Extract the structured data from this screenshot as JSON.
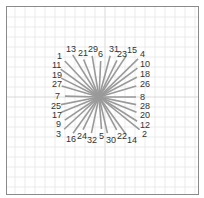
{
  "diagram": {
    "type": "radial-spoke-test-pattern",
    "center": [
      99,
      97
    ],
    "spoke_color": "#9a9a9a",
    "grid_color": "#e6e6e6",
    "grid_major_color": "#cfcfcf",
    "frame_color": "#8a8a8a",
    "labels": [
      {
        "text": "1",
        "x": 57,
        "y": 59
      },
      {
        "text": "13",
        "x": 66,
        "y": 52
      },
      {
        "text": "21",
        "x": 78,
        "y": 56
      },
      {
        "text": "29",
        "x": 88,
        "y": 52
      },
      {
        "text": "6",
        "x": 98,
        "y": 57
      },
      {
        "text": "31",
        "x": 109,
        "y": 52
      },
      {
        "text": "23",
        "x": 117,
        "y": 57
      },
      {
        "text": "15",
        "x": 127,
        "y": 53
      },
      {
        "text": "4",
        "x": 140,
        "y": 57
      },
      {
        "text": "10",
        "x": 140,
        "y": 67
      },
      {
        "text": "18",
        "x": 140,
        "y": 77
      },
      {
        "text": "26",
        "x": 140,
        "y": 87
      },
      {
        "text": "8",
        "x": 140,
        "y": 100
      },
      {
        "text": "28",
        "x": 140,
        "y": 109
      },
      {
        "text": "20",
        "x": 140,
        "y": 118
      },
      {
        "text": "12",
        "x": 140,
        "y": 128
      },
      {
        "text": "2",
        "x": 142,
        "y": 137
      },
      {
        "text": "14",
        "x": 127,
        "y": 143
      },
      {
        "text": "22",
        "x": 117,
        "y": 139
      },
      {
        "text": "30",
        "x": 106,
        "y": 143
      },
      {
        "text": "5",
        "x": 99,
        "y": 139
      },
      {
        "text": "32",
        "x": 87,
        "y": 143
      },
      {
        "text": "24",
        "x": 77,
        "y": 139
      },
      {
        "text": "16",
        "x": 66,
        "y": 142
      },
      {
        "text": "3",
        "x": 56,
        "y": 137
      },
      {
        "text": "9",
        "x": 56,
        "y": 127
      },
      {
        "text": "17",
        "x": 52,
        "y": 118
      },
      {
        "text": "25",
        "x": 51,
        "y": 109
      },
      {
        "text": "7",
        "x": 55,
        "y": 99
      },
      {
        "text": "27",
        "x": 52,
        "y": 87
      },
      {
        "text": "19",
        "x": 52,
        "y": 78
      },
      {
        "text": "11",
        "x": 52,
        "y": 68
      }
    ]
  }
}
